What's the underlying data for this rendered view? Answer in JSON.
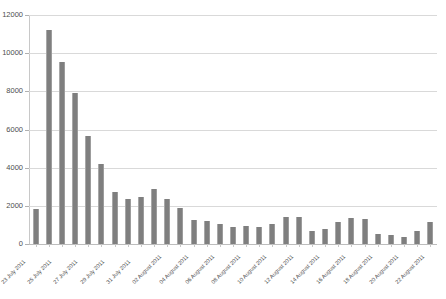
{
  "chart_data": {
    "type": "bar",
    "title": "",
    "subtitle": "",
    "xlabel": "",
    "ylabel": "",
    "ylim": [
      0,
      12000
    ],
    "y_ticks": [
      0,
      2000,
      4000,
      6000,
      8000,
      10000,
      12000
    ],
    "y_tick_labels": [
      "0",
      "2000",
      "4000",
      "6000",
      "8000",
      "10000",
      "12000"
    ],
    "grid": true,
    "legend": false,
    "legend_position": "none",
    "bar_color": "#7f7f7f",
    "gridline_color": "#d9d9d9",
    "axis_color": "#c8c8c8",
    "label_color": "#4d4d4d",
    "x_label_rotation": -45,
    "x_label_interval": 2,
    "categories": [
      "23 July 2011",
      "24 July 2011",
      "25 July 2011",
      "26 July 2011",
      "27 July 2011",
      "28 July 2011",
      "29 July 2011",
      "30 July 2011",
      "31 July 2011",
      "01 August 2011",
      "02 August 2011",
      "03 August 2011",
      "04 August 2011",
      "05 August 2011",
      "06 August 2011",
      "07 August 2011",
      "08 August 2011",
      "09 August 2011",
      "10 August 2011",
      "11 August 2011",
      "12 August 2011",
      "13 August 2011",
      "14 August 2011",
      "15 August 2011",
      "16 August 2011",
      "17 August 2011",
      "18 August 2011",
      "19 August 2011",
      "20 August 2011",
      "21 August 2011",
      "22 August 2011"
    ],
    "visible_x_tick_labels": [
      "23 July 2011",
      "25 July 2011",
      "27 July 2011",
      "29 July 2011",
      "31 July 2011",
      "02 August 2011",
      "04 August 2011",
      "06 August 2011",
      "08 August 2011",
      "10 August 2011",
      "12 August 2011",
      "14 August 2011",
      "16 August 2011",
      "18 August 2011",
      "20 August 2011",
      "22 August 2011"
    ],
    "values": [
      1850,
      11200,
      9550,
      7900,
      5650,
      4200,
      2750,
      2350,
      2450,
      2900,
      2350,
      1900,
      1250,
      1200,
      1050,
      900,
      950,
      900,
      1050,
      1400,
      1400,
      700,
      800,
      1150,
      1350,
      1300,
      500,
      450,
      350,
      700,
      1150
    ]
  }
}
